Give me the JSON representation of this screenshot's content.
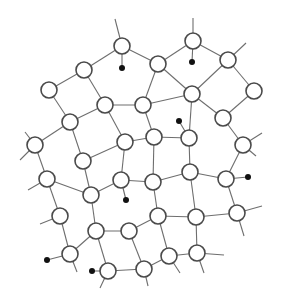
{
  "diagram": {
    "type": "network-graph",
    "colors": {
      "background": "#ffffff",
      "edge": "#6e6e6e",
      "node_stroke": "#4a4a4a",
      "node_fill": "#ffffff",
      "dot": "#111111"
    },
    "node_radius": 8,
    "dot_radius": 3,
    "nodes": [
      {
        "id": "n1",
        "x": 122,
        "y": 46
      },
      {
        "id": "n2",
        "x": 84,
        "y": 70
      },
      {
        "id": "n3",
        "x": 49,
        "y": 90
      },
      {
        "id": "n4",
        "x": 105,
        "y": 105
      },
      {
        "id": "n5",
        "x": 143,
        "y": 105
      },
      {
        "id": "n6",
        "x": 193,
        "y": 41
      },
      {
        "id": "n7",
        "x": 158,
        "y": 64
      },
      {
        "id": "n8",
        "x": 228,
        "y": 60
      },
      {
        "id": "n9",
        "x": 254,
        "y": 91
      },
      {
        "id": "n10",
        "x": 192,
        "y": 94
      },
      {
        "id": "n11",
        "x": 223,
        "y": 118
      },
      {
        "id": "n12",
        "x": 70,
        "y": 122
      },
      {
        "id": "n13",
        "x": 35,
        "y": 145
      },
      {
        "id": "n14",
        "x": 125,
        "y": 142
      },
      {
        "id": "n15",
        "x": 154,
        "y": 137
      },
      {
        "id": "n16",
        "x": 189,
        "y": 138
      },
      {
        "id": "n17",
        "x": 243,
        "y": 145
      },
      {
        "id": "n18",
        "x": 83,
        "y": 161
      },
      {
        "id": "n19",
        "x": 47,
        "y": 179
      },
      {
        "id": "n20",
        "x": 121,
        "y": 180
      },
      {
        "id": "n21",
        "x": 153,
        "y": 182
      },
      {
        "id": "n22",
        "x": 190,
        "y": 172
      },
      {
        "id": "n23",
        "x": 226,
        "y": 179
      },
      {
        "id": "n24",
        "x": 91,
        "y": 195
      },
      {
        "id": "n25",
        "x": 60,
        "y": 216
      },
      {
        "id": "n26",
        "x": 96,
        "y": 231
      },
      {
        "id": "n27",
        "x": 129,
        "y": 231
      },
      {
        "id": "n28",
        "x": 158,
        "y": 216
      },
      {
        "id": "n29",
        "x": 196,
        "y": 217
      },
      {
        "id": "n30",
        "x": 237,
        "y": 213
      },
      {
        "id": "n31",
        "x": 70,
        "y": 254
      },
      {
        "id": "n32",
        "x": 108,
        "y": 271
      },
      {
        "id": "n33",
        "x": 144,
        "y": 269
      },
      {
        "id": "n34",
        "x": 169,
        "y": 256
      },
      {
        "id": "n35",
        "x": 197,
        "y": 253
      }
    ],
    "edges": [
      [
        "n1",
        "n2"
      ],
      [
        "n1",
        "n7"
      ],
      [
        "n2",
        "n3"
      ],
      [
        "n2",
        "n4"
      ],
      [
        "n4",
        "n5"
      ],
      [
        "n5",
        "n7"
      ],
      [
        "n6",
        "n7"
      ],
      [
        "n6",
        "n8"
      ],
      [
        "n7",
        "n10"
      ],
      [
        "n8",
        "n9"
      ],
      [
        "n8",
        "n10"
      ],
      [
        "n9",
        "n11"
      ],
      [
        "n10",
        "n11"
      ],
      [
        "n5",
        "n10"
      ],
      [
        "n3",
        "n12"
      ],
      [
        "n4",
        "n12"
      ],
      [
        "n12",
        "n13"
      ],
      [
        "n4",
        "n14"
      ],
      [
        "n14",
        "n15"
      ],
      [
        "n5",
        "n15"
      ],
      [
        "n15",
        "n16"
      ],
      [
        "n10",
        "n16"
      ],
      [
        "n11",
        "n17"
      ],
      [
        "n12",
        "n18"
      ],
      [
        "n13",
        "n19"
      ],
      [
        "n18",
        "n14"
      ],
      [
        "n18",
        "n24"
      ],
      [
        "n14",
        "n20"
      ],
      [
        "n15",
        "n21"
      ],
      [
        "n16",
        "n22"
      ],
      [
        "n17",
        "n23"
      ],
      [
        "n20",
        "n21"
      ],
      [
        "n21",
        "n22"
      ],
      [
        "n22",
        "n23"
      ],
      [
        "n19",
        "n24"
      ],
      [
        "n19",
        "n25"
      ],
      [
        "n24",
        "n26"
      ],
      [
        "n20",
        "n24"
      ],
      [
        "n26",
        "n27"
      ],
      [
        "n21",
        "n28"
      ],
      [
        "n22",
        "n29"
      ],
      [
        "n23",
        "n30"
      ],
      [
        "n27",
        "n28"
      ],
      [
        "n28",
        "n29"
      ],
      [
        "n29",
        "n30"
      ],
      [
        "n25",
        "n31"
      ],
      [
        "n26",
        "n31"
      ],
      [
        "n26",
        "n32"
      ],
      [
        "n27",
        "n33"
      ],
      [
        "n32",
        "n33"
      ],
      [
        "n33",
        "n34"
      ],
      [
        "n28",
        "n34"
      ],
      [
        "n34",
        "n35"
      ],
      [
        "n29",
        "n35"
      ]
    ],
    "stubs": [
      {
        "from": "n1",
        "x": 115,
        "y": 19
      },
      {
        "from": "n6",
        "x": 193,
        "y": 18
      },
      {
        "from": "n8",
        "x": 246,
        "y": 43
      },
      {
        "from": "n13",
        "x": 25,
        "y": 132
      },
      {
        "from": "n13",
        "x": 20,
        "y": 160
      },
      {
        "from": "n19",
        "x": 28,
        "y": 190
      },
      {
        "from": "n25",
        "x": 40,
        "y": 224
      },
      {
        "from": "n17",
        "x": 262,
        "y": 133
      },
      {
        "from": "n17",
        "x": 256,
        "y": 156
      },
      {
        "from": "n30",
        "x": 262,
        "y": 206
      },
      {
        "from": "n30",
        "x": 244,
        "y": 236
      },
      {
        "from": "n35",
        "x": 224,
        "y": 255
      },
      {
        "from": "n35",
        "x": 204,
        "y": 273
      },
      {
        "from": "n34",
        "x": 180,
        "y": 273
      },
      {
        "from": "n31",
        "x": 77,
        "y": 272
      },
      {
        "from": "n32",
        "x": 100,
        "y": 288
      },
      {
        "from": "n33",
        "x": 148,
        "y": 286
      }
    ],
    "dots": [
      {
        "attached_to": "n1",
        "x": 122,
        "y": 68
      },
      {
        "attached_to": "n6",
        "x": 192,
        "y": 62
      },
      {
        "attached_to": "n16",
        "x": 179,
        "y": 121
      },
      {
        "attached_to": "n20",
        "x": 126,
        "y": 200
      },
      {
        "attached_to": "n23",
        "x": 248,
        "y": 177
      },
      {
        "attached_to": "n31",
        "x": 47,
        "y": 260
      },
      {
        "attached_to": "n32",
        "x": 92,
        "y": 271
      }
    ]
  }
}
